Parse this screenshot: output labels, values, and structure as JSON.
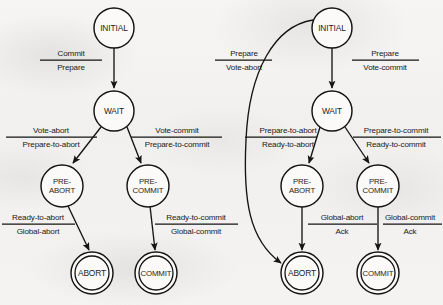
{
  "figure": {
    "width": 443,
    "height": 305,
    "background_color": "#f3f2f0",
    "ink_color": "#141414"
  },
  "diagrams": [
    {
      "id": "coordinator",
      "name": "coordinator-state-diagram",
      "nodes": [
        {
          "id": "initial",
          "label": "INITIAL",
          "cx": 114,
          "cy": 28,
          "r": 20,
          "terminal": false
        },
        {
          "id": "wait",
          "label": "WAIT",
          "cx": 114,
          "cy": 111,
          "r": 20,
          "terminal": false
        },
        {
          "id": "preabort",
          "label": "PRE-\nABORT",
          "cx": 62,
          "cy": 186,
          "r": 21,
          "terminal": false
        },
        {
          "id": "precommit",
          "label": "PRE-\nCOMMIT",
          "cx": 148,
          "cy": 186,
          "r": 21,
          "terminal": false
        },
        {
          "id": "abort",
          "label": "ABORT",
          "cx": 92,
          "cy": 273,
          "r": 21,
          "terminal": true
        },
        {
          "id": "commit",
          "label": "COMMIT",
          "cx": 156,
          "cy": 273,
          "r": 21,
          "terminal": true
        }
      ],
      "edges": [
        {
          "id": "initial-wait",
          "from": "initial",
          "to": "wait",
          "top": "Commit",
          "bottom": "Prepare"
        },
        {
          "id": "wait-preabort",
          "from": "wait",
          "to": "preabort",
          "top": "Vote-abort",
          "bottom": "Prepare-to-abort"
        },
        {
          "id": "wait-precommit",
          "from": "wait",
          "to": "precommit",
          "top": "Vote-commit",
          "bottom": "Prepare-to-commit"
        },
        {
          "id": "preabort-abort",
          "from": "preabort",
          "to": "abort",
          "top": "Ready-to-abort",
          "bottom": "Global-abort"
        },
        {
          "id": "precommit-commit",
          "from": "precommit",
          "to": "commit",
          "top": "Ready-to-commit",
          "bottom": "Global-commit"
        }
      ]
    },
    {
      "id": "participant",
      "name": "participant-state-diagram",
      "nodes": [
        {
          "id": "initial",
          "label": "INITIAL",
          "cx": 332,
          "cy": 28,
          "r": 20,
          "terminal": false
        },
        {
          "id": "wait",
          "label": "WAIT",
          "cx": 332,
          "cy": 111,
          "r": 20,
          "terminal": false
        },
        {
          "id": "preabort",
          "label": "PRE-\nABORT",
          "cx": 302,
          "cy": 186,
          "r": 21,
          "terminal": false
        },
        {
          "id": "precommit",
          "label": "PRE-\nCOMMIT",
          "cx": 378,
          "cy": 186,
          "r": 21,
          "terminal": false
        },
        {
          "id": "abort",
          "label": "ABORT",
          "cx": 302,
          "cy": 273,
          "r": 21,
          "terminal": true
        },
        {
          "id": "commit",
          "label": "COMMIT",
          "cx": 378,
          "cy": 273,
          "r": 21,
          "terminal": true
        }
      ],
      "edges": [
        {
          "id": "initial-abort",
          "from": "initial",
          "to": "abort",
          "top": "Prepare",
          "bottom": "Vote-abort",
          "curved": true
        },
        {
          "id": "initial-wait",
          "from": "initial",
          "to": "wait",
          "top": "Prepare",
          "bottom": "Vote-commit"
        },
        {
          "id": "wait-preabort",
          "from": "wait",
          "to": "preabort",
          "top": "Prepare-to-abort",
          "bottom": "Ready-to-abort"
        },
        {
          "id": "wait-precommit",
          "from": "wait",
          "to": "precommit",
          "top": "Prepare-to-commit",
          "bottom": "Ready-to-commit"
        },
        {
          "id": "preabort-abort",
          "from": "preabort",
          "to": "abort",
          "top": "Global-abort",
          "bottom": "Ack"
        },
        {
          "id": "precommit-commit",
          "from": "precommit",
          "to": "commit",
          "top": "Global-commit",
          "bottom": "Ack"
        }
      ]
    }
  ],
  "labels": {
    "left": {
      "initial": "INITIAL",
      "wait": "WAIT",
      "preabort_line1": "PRE-",
      "preabort_line2": "ABORT",
      "precommit_line1": "PRE-",
      "precommit_line2": "COMMIT",
      "abort": "ABORT",
      "commit": "COMMIT",
      "e1_top": "Commit",
      "e1_bottom": "Prepare",
      "e2_top": "Vote-abort",
      "e2_bottom": "Prepare-to-abort",
      "e3_top": "Vote-commit",
      "e3_bottom": "Prepare-to-commit",
      "e4_top": "Ready-to-abort",
      "e4_bottom": "Global-abort",
      "e5_top": "Ready-to-commit",
      "e5_bottom": "Global-commit"
    },
    "right": {
      "initial": "INITIAL",
      "wait": "WAIT",
      "preabort_line1": "PRE-",
      "preabort_line2": "ABORT",
      "precommit_line1": "PRE-",
      "precommit_line2": "COMMIT",
      "abort": "ABORT",
      "commit": "COMMIT",
      "e1_top": "Prepare",
      "e1_bottom": "Vote-abort",
      "e2_top": "Prepare",
      "e2_bottom": "Vote-commit",
      "e3_top": "Prepare-to-abort",
      "e3_bottom": "Ready-to-abort",
      "e4_top": "Prepare-to-commit",
      "e4_bottom": "Ready-to-commit",
      "e5_top": "Global-abort",
      "e5_bottom": "Ack",
      "e6_top": "Global-commit",
      "e6_bottom": "Ack"
    }
  }
}
